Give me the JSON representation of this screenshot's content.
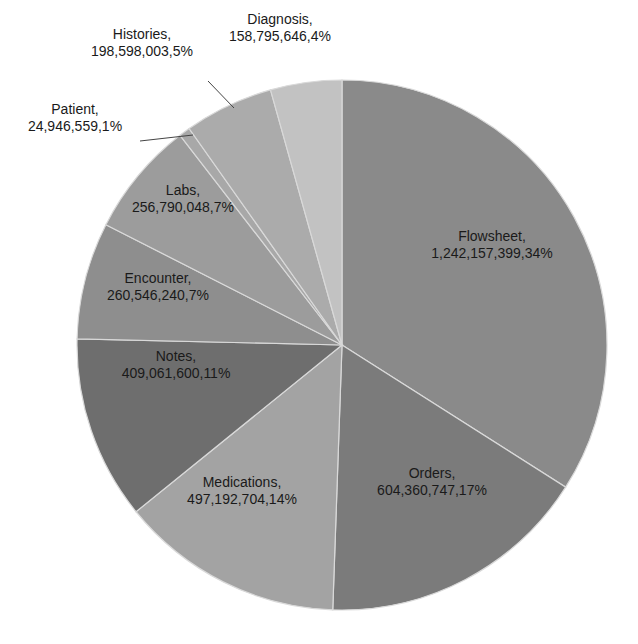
{
  "chart_data": {
    "type": "pie",
    "title": "",
    "start_angle_deg": 0,
    "direction": "clockwise",
    "center": [
      342,
      345
    ],
    "radius": 265,
    "slices": [
      {
        "label": "Flowsheet",
        "value": 1242157399,
        "percent": "34%",
        "value_text": "1,242,157,399,34%",
        "color": "#8a8a8a",
        "label_pos": [
          492,
          245
        ]
      },
      {
        "label": "Orders",
        "value": 604360747,
        "percent": "17%",
        "value_text": "604,360,747,17%",
        "color": "#7b7b7b",
        "label_pos": [
          432,
          482
        ]
      },
      {
        "label": "Medications",
        "value": 497192704,
        "percent": "14%",
        "value_text": "497,192,704,14%",
        "color": "#a3a3a3",
        "label_pos": [
          242,
          491
        ]
      },
      {
        "label": "Notes",
        "value": 409061600,
        "percent": "11%",
        "value_text": "409,061,600,11%",
        "color": "#6e6e6e",
        "label_pos": [
          176,
          365
        ]
      },
      {
        "label": "Encounter",
        "value": 260546240,
        "percent": "7%",
        "value_text": "260,546,240,7%",
        "color": "#8e8e8e",
        "label_pos": [
          158,
          287
        ]
      },
      {
        "label": "Labs",
        "value": 256790048,
        "percent": "7%",
        "value_text": "256,790,048,7%",
        "color": "#9c9c9c",
        "label_pos": [
          183,
          199
        ]
      },
      {
        "label": "Patient",
        "value": 24946559,
        "percent": "1%",
        "value_text": "24,946,559,1%",
        "color": "#a8a8a8",
        "label_pos": [
          75,
          118
        ],
        "leader": [
          [
            140,
            141
          ],
          [
            193,
            135
          ]
        ]
      },
      {
        "label": "Histories",
        "value": 198598003,
        "percent": "5%",
        "value_text": "198,598,003,5%",
        "color": "#ababab",
        "label_pos": [
          142,
          43
        ],
        "leader": [
          [
            208,
            81
          ],
          [
            234,
            108
          ]
        ]
      },
      {
        "label": "Diagnosis",
        "value": 158795646,
        "percent": "4%",
        "value_text": "158,795,646,4%",
        "color": "#c2c2c2",
        "label_pos": [
          280,
          28
        ]
      }
    ],
    "slice_border_color": "#d9d9d9",
    "legend": "none",
    "labels_inline": true
  }
}
